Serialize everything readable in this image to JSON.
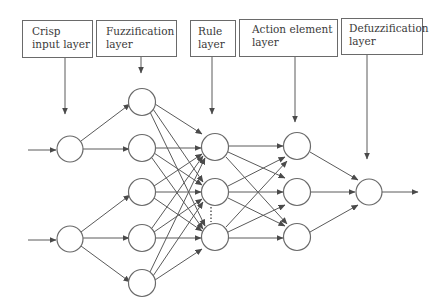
{
  "diagram": {
    "type": "neuro-fuzzy network",
    "layers": [
      {
        "id": "crisp",
        "label_line1": "Crisp",
        "label_line2": "input layer",
        "node_count": 2
      },
      {
        "id": "fuzz",
        "label_line1": "Fuzzification",
        "label_line2": "layer",
        "node_count": 5
      },
      {
        "id": "rule",
        "label_line1": "Rule",
        "label_line2": "layer",
        "node_count": 3
      },
      {
        "id": "action",
        "label_line1": "Action element",
        "label_line2": "layer",
        "node_count": 3
      },
      {
        "id": "defuzz",
        "label_line1": "Defuzzification",
        "label_line2": "layer",
        "node_count": 1
      }
    ],
    "colors": {
      "line": "#5a5a5a",
      "box_border": "#6a6a6a",
      "text": "#3a3a3a"
    }
  }
}
